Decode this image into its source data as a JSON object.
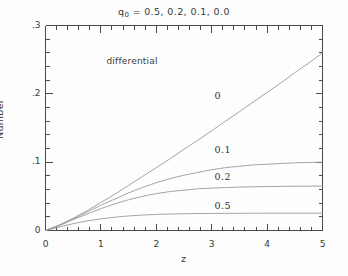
{
  "figure": {
    "title_prefix": "q",
    "title_subscript": "0",
    "title_rest": " = 0.5, 0.2, 0.1, 0.0",
    "title_full": "q0 = 0.5, 0.2, 0.1, 0.0",
    "annotation": "differential",
    "axis_color": "#4a4a4a",
    "curve_color": "#9a9a9a",
    "background": "#fdfdfd"
  },
  "chart_data": {
    "type": "line",
    "title": "q0 = 0.5, 0.2, 0.1, 0.0",
    "xlabel": "z",
    "ylabel": "Number",
    "xlim": [
      0,
      5
    ],
    "ylim": [
      0,
      0.3
    ],
    "xticks": [
      0,
      1,
      2,
      3,
      4,
      5
    ],
    "xtick_labels": [
      "0",
      "1",
      "2",
      "3",
      "4",
      "5"
    ],
    "yticks": [
      0,
      0.1,
      0.2,
      0.3
    ],
    "ytick_labels": [
      "0",
      ".1",
      ".2",
      ".3"
    ],
    "xminor_step": 0.2,
    "yminor_step": 0.02,
    "grid": false,
    "legend": "inline-curve-labels",
    "annotations": [
      {
        "text": "differential",
        "x": 1.1,
        "y": 0.247
      },
      {
        "text": "0",
        "x": 3.05,
        "y": 0.197
      },
      {
        "text": "0.1",
        "x": 3.05,
        "y": 0.118
      },
      {
        "text": "0.2",
        "x": 3.05,
        "y": 0.079
      },
      {
        "text": "0.5",
        "x": 3.05,
        "y": 0.036
      }
    ],
    "series": [
      {
        "name": "q0 = 0.0",
        "label": "0",
        "x": [
          0,
          0.25,
          0.5,
          0.75,
          1,
          1.25,
          1.5,
          1.75,
          2,
          2.25,
          2.5,
          2.75,
          3,
          3.25,
          3.5,
          3.75,
          4,
          4.25,
          4.5,
          4.75,
          5
        ],
        "y": [
          0,
          0.008,
          0.018,
          0.029,
          0.041,
          0.053,
          0.066,
          0.079,
          0.092,
          0.105,
          0.119,
          0.132,
          0.146,
          0.16,
          0.174,
          0.188,
          0.202,
          0.216,
          0.231,
          0.245,
          0.26
        ]
      },
      {
        "name": "q0 = 0.1",
        "label": "0.1",
        "x": [
          0,
          0.25,
          0.5,
          0.75,
          1,
          1.25,
          1.5,
          1.75,
          2,
          2.25,
          2.5,
          2.75,
          3,
          3.25,
          3.5,
          3.75,
          4,
          4.25,
          4.5,
          4.75,
          5
        ],
        "y": [
          0,
          0.008,
          0.017,
          0.027,
          0.037,
          0.046,
          0.055,
          0.063,
          0.07,
          0.076,
          0.081,
          0.085,
          0.089,
          0.092,
          0.094,
          0.096,
          0.097,
          0.098,
          0.099,
          0.0995,
          0.1
        ]
      },
      {
        "name": "q0 = 0.2",
        "label": "0.2",
        "x": [
          0,
          0.25,
          0.5,
          0.75,
          1,
          1.25,
          1.5,
          1.75,
          2,
          2.25,
          2.5,
          2.75,
          3,
          3.25,
          3.5,
          3.75,
          4,
          4.25,
          4.5,
          4.75,
          5
        ],
        "y": [
          0,
          0.007,
          0.016,
          0.024,
          0.032,
          0.039,
          0.045,
          0.05,
          0.054,
          0.057,
          0.059,
          0.061,
          0.062,
          0.0628,
          0.0635,
          0.064,
          0.0643,
          0.0646,
          0.0648,
          0.0649,
          0.065
        ]
      },
      {
        "name": "q0 = 0.5",
        "label": "0.5",
        "x": [
          0,
          0.25,
          0.5,
          0.75,
          1,
          1.25,
          1.5,
          1.75,
          2,
          2.25,
          2.5,
          2.75,
          3,
          3.25,
          3.5,
          3.75,
          4,
          4.25,
          4.5,
          4.75,
          5
        ],
        "y": [
          0,
          0.005,
          0.01,
          0.014,
          0.017,
          0.0195,
          0.0213,
          0.0226,
          0.0235,
          0.0241,
          0.0245,
          0.0248,
          0.025,
          0.0251,
          0.0252,
          0.0252,
          0.0253,
          0.0253,
          0.0253,
          0.0253,
          0.0253
        ]
      }
    ]
  }
}
